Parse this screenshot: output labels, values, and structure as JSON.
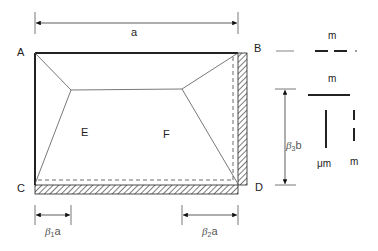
{
  "diagram": {
    "type": "yield-line slab diagram",
    "dimension_top": "a",
    "corners": {
      "A": "A",
      "B": "B",
      "C": "C",
      "D": "D"
    },
    "regions": {
      "E": "E",
      "F": "F"
    },
    "dim_beta1": {
      "symbol": "β",
      "sub": "1",
      "suffix": "a"
    },
    "dim_beta2": {
      "symbol": "β",
      "sub": "2",
      "suffix": "a"
    },
    "dim_beta3": {
      "symbol": "β",
      "sub": "3",
      "suffix": "b"
    },
    "legend": {
      "item1_label": "m",
      "item2_label": "m",
      "item3_label": "μm",
      "item4_label": "m"
    },
    "colors": {
      "line": "#222222",
      "thin": "#555555"
    }
  }
}
